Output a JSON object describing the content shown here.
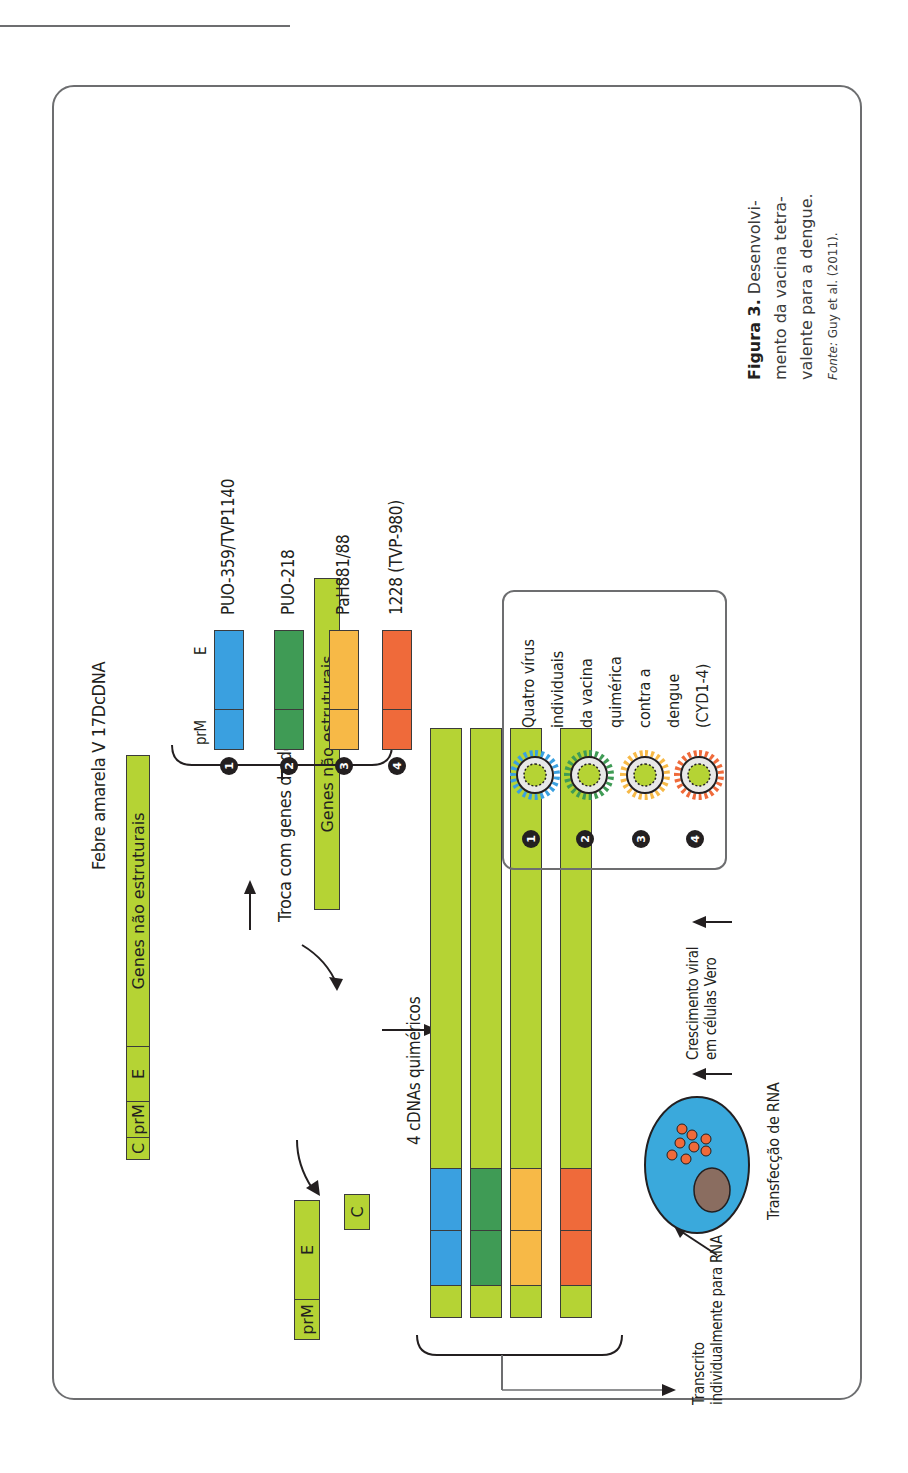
{
  "colors": {
    "lime": "#b5d334",
    "serotype1": "#3aa0e0",
    "serotype2": "#3f9b55",
    "serotype3": "#f7b947",
    "serotype4": "#ef6a3a",
    "cell": "#3aa9dc",
    "nucleus": "#8a6d60"
  },
  "figure": {
    "yf_title": "Febre amarela V 17DcDNA",
    "yf_bar": {
      "c": "C",
      "prm": "prM",
      "e": "E",
      "ns": "Genes não estruturais"
    },
    "swap_label": "Troca com genes da dengue wt 1-4",
    "ns_bar_label": "Genes não estruturais",
    "removed": {
      "prm": "prM",
      "e": "E",
      "c": "C"
    },
    "chimeric_label": "4 cDNAs quiméricos",
    "donor_header": {
      "prm": "prM",
      "e": "E"
    },
    "donors": [
      {
        "num": "1",
        "name": "PUO-359/TVP1140"
      },
      {
        "num": "2",
        "name": "PUO-218"
      },
      {
        "num": "3",
        "name": "PaH881/88"
      },
      {
        "num": "4",
        "name": "1228 (TVP-980)"
      }
    ],
    "transcribed_label_1": "Transcrito",
    "transcribed_label_2": "individualmente para RNA",
    "transfection_label": "Transfecção de RNA",
    "growth_label_1": "Crescimento viral",
    "growth_label_2": "em células Vero",
    "virus_panel": {
      "numbers": [
        "1",
        "2",
        "3",
        "4"
      ],
      "text": [
        "Quatro vírus",
        "individuais",
        "da vacina",
        "quimérica",
        "contra a",
        "dengue",
        "(CYD1-4)"
      ]
    }
  },
  "caption": {
    "label": "Figura 3.",
    "line1": "Desenvolvi-",
    "line2": "mento da vacina tetra-",
    "line3": "valente para a dengue.",
    "source_label": "Fonte:",
    "source_text": "Guy et al. (2011)."
  }
}
